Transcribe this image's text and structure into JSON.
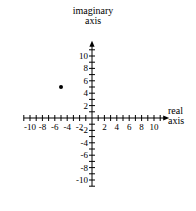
{
  "chart_data": {
    "type": "scatter",
    "title": "imaginary axis",
    "xlabel": "real axis",
    "ylabel": "imaginary axis",
    "xlim": [
      -11,
      11
    ],
    "ylim": [
      -11,
      11
    ],
    "grid": false,
    "legend": "none",
    "x_tick_labels": [
      "-10",
      "-8",
      "-6",
      "-4",
      "-2",
      "2",
      "4",
      "6",
      "8",
      "10"
    ],
    "x_tick_values": [
      -10,
      -8,
      -6,
      -4,
      -2,
      2,
      4,
      6,
      8,
      10
    ],
    "y_tick_labels": [
      "10",
      "8",
      "6",
      "4",
      "2",
      "-2",
      "-4",
      "-6",
      "-8",
      "-10"
    ],
    "y_tick_values": [
      10,
      8,
      6,
      4,
      2,
      -2,
      -4,
      -6,
      -8,
      -10
    ],
    "minor_tick_step": 1,
    "points": [
      {
        "x": -5,
        "y": 5,
        "label": ""
      }
    ]
  },
  "labels": {
    "imaginary_axis_line1": "imaginary",
    "imaginary_axis_line2": "axis",
    "real_axis_line1": "real",
    "real_axis_line2": "axis"
  },
  "colors": {
    "axis": "#000000",
    "point": "#000000",
    "background": "#ffffff",
    "text": "#000000"
  }
}
